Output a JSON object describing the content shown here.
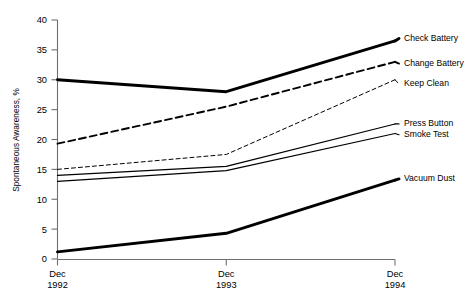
{
  "chart_data": {
    "type": "line",
    "title": "",
    "xlabel": "",
    "ylabel": "Spontaneous Awareness, %",
    "x": [
      "Dec 1992",
      "Dec 1993",
      "Dec 1994"
    ],
    "categories": [
      "Dec 1992",
      "Dec 1993",
      "Dec 1994"
    ],
    "xtick_lines": [
      [
        "Dec",
        "1992"
      ],
      [
        "Dec",
        "1993"
      ],
      [
        "Dec",
        "1994"
      ]
    ],
    "ylim": [
      0,
      40
    ],
    "yticks": [
      0,
      5,
      10,
      15,
      20,
      25,
      30,
      35,
      40
    ],
    "ytick_labels": [
      "0",
      "5",
      "10",
      "15",
      "20",
      "25",
      "30",
      "35",
      "40"
    ],
    "grid": false,
    "legend_position": "right-of-plot-at-line-ends",
    "series": [
      {
        "name": "Check Battery",
        "values": [
          30.0,
          28.0,
          36.5
        ],
        "style": "solid",
        "width": 2.9,
        "color": "#000000",
        "label_y": 36.9
      },
      {
        "name": "Change Battery",
        "values": [
          19.3,
          25.5,
          33.0
        ],
        "style": "dashed",
        "dash": "7,4",
        "width": 1.9,
        "color": "#000000",
        "label_y": 32.7
      },
      {
        "name": "Keep Clean",
        "values": [
          15.0,
          17.5,
          30.0
        ],
        "style": "dotted-dashed",
        "dash": "4,3",
        "width": 1.0,
        "color": "#000000",
        "label_y": 29.3
      },
      {
        "name": "Press Button",
        "values": [
          14.0,
          15.5,
          22.6
        ],
        "style": "solid",
        "width": 1.2,
        "color": "#000000",
        "label_y": 22.6
      },
      {
        "name": "Smoke Test",
        "values": [
          13.0,
          14.8,
          21.0
        ],
        "style": "solid",
        "width": 1.2,
        "color": "#000000",
        "label_y": 20.8
      },
      {
        "name": "Vacuum Dust",
        "values": [
          1.2,
          4.3,
          13.2
        ],
        "style": "solid",
        "width": 2.9,
        "color": "#000000",
        "label_y": 13.4
      }
    ]
  },
  "legend": {
    "items": [
      {
        "label": "Check Battery"
      },
      {
        "label": "Change Battery"
      },
      {
        "label": "Keep Clean"
      },
      {
        "label": "Press Button"
      },
      {
        "label": "Smoke Test"
      },
      {
        "label": "Vacuum Dust"
      }
    ]
  }
}
